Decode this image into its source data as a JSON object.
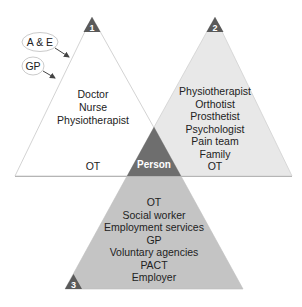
{
  "diagram": {
    "colors": {
      "triangle1_fill": "#ffffff",
      "triangle1_stroke": "#c8c8c8",
      "triangle2_fill": "#e8e8e8",
      "triangle3_fill": "#c4c4c4",
      "person_fill": "#6e6e6e",
      "badge_fill": "#5a5a5a",
      "base_line": "#b5b5b5"
    },
    "entry_points": [
      {
        "label": "A & E"
      },
      {
        "label": "GP"
      }
    ],
    "triangles": [
      {
        "number": "1",
        "members": [
          "Doctor",
          "Nurse",
          "Physiotherapist"
        ],
        "footer": "OT"
      },
      {
        "number": "2",
        "members": [
          "Physiotherapist",
          "Orthotist",
          "Prosthetist",
          "Psychologist",
          "Pain team",
          "Family",
          "OT"
        ]
      },
      {
        "number": "3",
        "members": [
          "OT",
          "Social worker",
          "Employment services",
          "GP",
          "Voluntary agencies",
          "PACT",
          "Employer"
        ]
      }
    ],
    "center": {
      "label": "Person"
    }
  }
}
